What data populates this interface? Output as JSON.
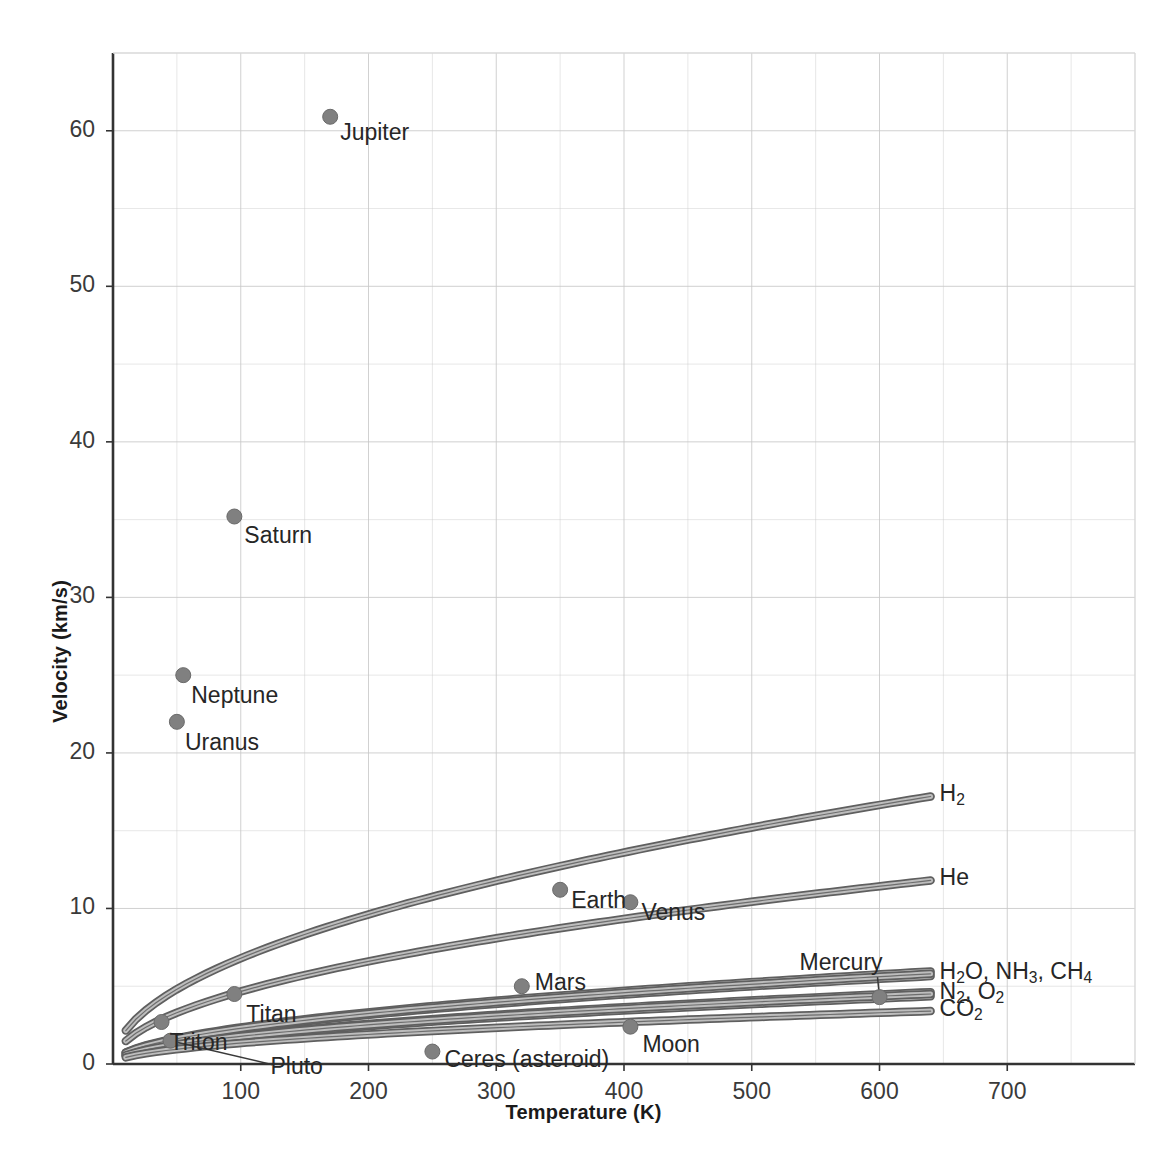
{
  "chart_data": {
    "type": "scatter",
    "title": "",
    "xlabel": "Temperature (K)",
    "ylabel": "Velocity (km/s)",
    "xlim": [
      0,
      800
    ],
    "ylim": [
      0,
      65
    ],
    "xticks": [
      100,
      200,
      300,
      400,
      500,
      600,
      700
    ],
    "yticks": [
      0,
      10,
      20,
      30,
      40,
      50,
      60
    ],
    "xtick_labels": [
      "100",
      "200",
      "300",
      "400",
      "500",
      "600",
      "700"
    ],
    "ytick_labels": [
      "0",
      "10",
      "20",
      "30",
      "40",
      "50",
      "60"
    ],
    "x_minor_step": 50,
    "y_minor_step": 5,
    "grid": true,
    "legend": "none",
    "marker_color": "#808080",
    "curve_color": "#6e6e6e",
    "grid_color": "#c9c9c9",
    "axis_color": "#333333",
    "points": [
      {
        "name": "Jupiter",
        "x": 170,
        "y": 60.9,
        "label": "Jupiter",
        "label_dx": 10,
        "label_dy": 4
      },
      {
        "name": "Saturn",
        "x": 95,
        "y": 35.2,
        "label": "Saturn",
        "label_dx": 10,
        "label_dy": 7
      },
      {
        "name": "Neptune",
        "x": 55,
        "y": 25.0,
        "label": "Neptune",
        "label_dx": 8,
        "label_dy": 9
      },
      {
        "name": "Uranus",
        "x": 50,
        "y": 22.0,
        "label": "Uranus",
        "label_dx": 8,
        "label_dy": 9
      },
      {
        "name": "Earth",
        "x": 350,
        "y": 11.2,
        "label": "Earth",
        "label_dx": 11,
        "label_dy": -1
      },
      {
        "name": "Venus",
        "x": 405,
        "y": 10.4,
        "label": "Venus",
        "label_dx": 11,
        "label_dy": -1
      },
      {
        "name": "Mars",
        "x": 320,
        "y": 5.0,
        "label": "Mars",
        "label_dx": 13,
        "label_dy": -15
      },
      {
        "name": "Titan",
        "x": 95,
        "y": 4.5,
        "label": "Titan",
        "label_dx": 12,
        "label_dy": 9
      },
      {
        "name": "Mercury",
        "x": 600,
        "y": 4.3,
        "label": "Mercury",
        "label_dx": -80,
        "label_dy": -46,
        "leader": true
      },
      {
        "name": "Triton",
        "x": 38,
        "y": 2.7,
        "label": "Triton",
        "label_dx": 8,
        "label_dy": 9
      },
      {
        "name": "Moon",
        "x": 405,
        "y": 2.4,
        "label": "Moon",
        "label_dx": 12,
        "label_dy": 6
      },
      {
        "name": "Pluto",
        "x": 45,
        "y": 1.5,
        "label": "Pluto",
        "label_dx": 100,
        "label_dy": 14,
        "leader": true
      },
      {
        "name": "Ceres (asteroid)",
        "x": 250,
        "y": 0.8,
        "label": "Ceres (asteroid)",
        "label_dx": 12,
        "label_dy": -4
      }
    ],
    "curves": [
      {
        "name": "H2",
        "label": "H₂",
        "label_html": "H<sub>2</sub>",
        "molar_mass": 2,
        "x_end": 640,
        "y_end": 17.2
      },
      {
        "name": "He",
        "label": "He",
        "label_html": "He",
        "molar_mass": 4,
        "x_end": 640,
        "y_end": 11.8
      },
      {
        "name": "H2O_NH3_CH4",
        "label": "H₂O, NH₃, CH₄",
        "label_html": "H<sub>2</sub>O, NH<sub>3</sub>, CH<sub>4</sub>",
        "molar_mass": 17,
        "x_end": 640,
        "y_end": 5.8
      },
      {
        "name": "N2_O2",
        "label": "N₂, O₂",
        "label_html": "N<sub>2</sub>, O<sub>2</sub>",
        "molar_mass": 30,
        "x_end": 640,
        "y_end": 4.5
      },
      {
        "name": "CO2",
        "label": "CO₂",
        "label_html": "CO<sub>2</sub>",
        "molar_mass": 44,
        "x_end": 640,
        "y_end": 3.4
      }
    ],
    "extra_curves": [
      {
        "name": "H2O_upper",
        "molar_mass": 16,
        "x_end": 640,
        "y_end": 5.95
      },
      {
        "name": "NH3_mid",
        "molar_mass": 18,
        "x_end": 640,
        "y_end": 5.65
      },
      {
        "name": "N2_upper",
        "molar_mass": 28,
        "x_end": 640,
        "y_end": 4.62
      },
      {
        "name": "O2_lower",
        "molar_mass": 32,
        "x_end": 640,
        "y_end": 4.35
      }
    ]
  }
}
